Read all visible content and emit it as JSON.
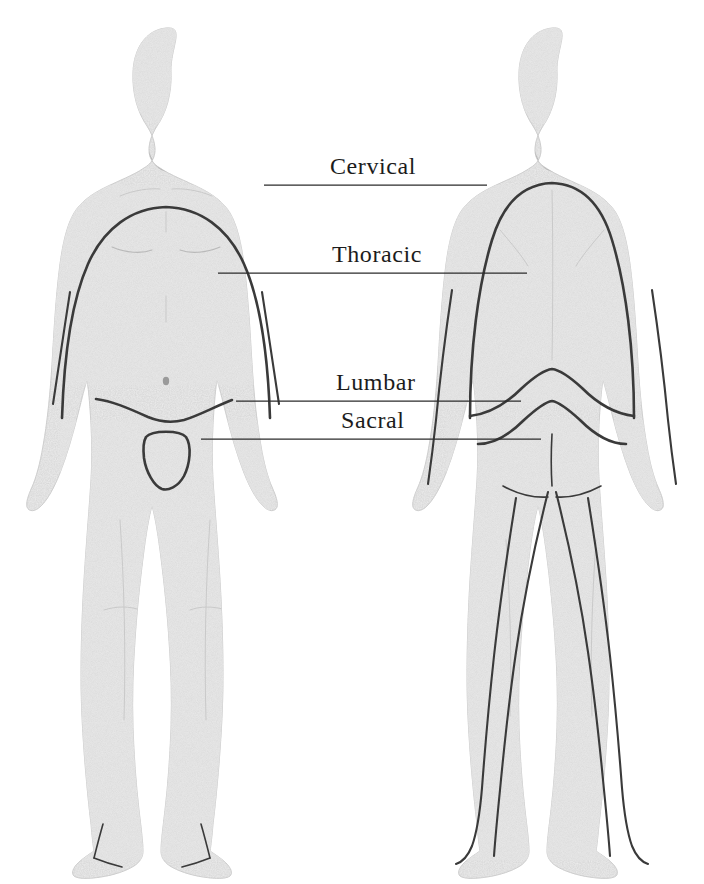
{
  "diagram": {
    "background_color": "#ffffff",
    "line_color": "#3a3a3a",
    "body_fill_color": "#ededed",
    "label_color": "#1c1c1c",
    "views": [
      {
        "id": "anterior",
        "name": "anterior-view",
        "side": "left"
      },
      {
        "id": "posterior",
        "name": "posterior-view",
        "side": "right"
      }
    ],
    "labels": [
      {
        "id": "cervical",
        "text": "Cervical",
        "text_x": 330,
        "text_y": 174,
        "leader_y": 185,
        "leader_x1": 264,
        "leader_x2": 487
      },
      {
        "id": "thoracic",
        "text": "Thoracic",
        "text_x": 332,
        "text_y": 262,
        "leader_y": 273,
        "leader_x1": 218,
        "leader_x2": 527
      },
      {
        "id": "lumbar",
        "text": "Lumbar",
        "text_x": 336,
        "text_y": 390,
        "leader_y": 401,
        "leader_x1": 236,
        "leader_x2": 521
      },
      {
        "id": "sacral",
        "text": "Sacral",
        "text_x": 341,
        "text_y": 428,
        "leader_y": 439,
        "leader_x1": 201,
        "leader_x2": 541
      }
    ]
  }
}
